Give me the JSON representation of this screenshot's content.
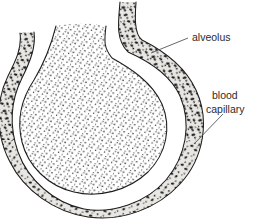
{
  "figure": {
    "type": "biological-diagram",
    "background_color": "#ffffff",
    "outline_color": "#1d1d1d",
    "capillary_fill_color": "#e9e7e3",
    "capillary_cell_color": "#1a1a1a",
    "alveolus_fill_color": "#ffffff",
    "alveolus_stipple_color": "#303030",
    "leader_line_color": "#55555a"
  },
  "labels": [
    {
      "id": "alveolus",
      "text": "alveolus",
      "x": 192,
      "y": 41,
      "lines": [
        "alveolus"
      ],
      "leader": {
        "x1": 151,
        "y1": 53,
        "x2": 188,
        "y2": 38
      }
    },
    {
      "id": "blood-capillary",
      "text": "blood capillary",
      "x": 212,
      "y": 99,
      "lines": [
        "blood",
        "capillary"
      ],
      "leader": {
        "x1": 194,
        "y1": 144,
        "x2": 223,
        "y2": 114
      }
    }
  ],
  "structures": [
    {
      "id": "alveolus-lumen",
      "name": "alveolus",
      "fill": "stipple-fine"
    },
    {
      "id": "capillary-band",
      "name": "blood capillary",
      "fill": "stipple-cells"
    },
    {
      "id": "capillary-left-branch",
      "name": "blood capillary left branch"
    },
    {
      "id": "capillary-right-branch",
      "name": "blood capillary right branch"
    }
  ]
}
